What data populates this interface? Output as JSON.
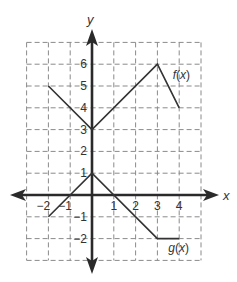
{
  "graph": {
    "x_axis_label": "x",
    "y_axis_label": "y",
    "x_range": [
      -3,
      5
    ],
    "y_range": [
      -3,
      7
    ],
    "x_tick_labels": [
      {
        "value": -2,
        "label": "−2"
      },
      {
        "value": -1,
        "label": "−1"
      },
      {
        "value": 1,
        "label": "1"
      },
      {
        "value": 2,
        "label": "2"
      },
      {
        "value": 3,
        "label": "3"
      },
      {
        "value": 4,
        "label": "4"
      }
    ],
    "y_tick_labels": [
      {
        "value": 6,
        "label": "6"
      },
      {
        "value": 5,
        "label": "5"
      },
      {
        "value": 4,
        "label": "4"
      },
      {
        "value": 3,
        "label": "3"
      },
      {
        "value": 2,
        "label": "2"
      },
      {
        "value": 1,
        "label": "1"
      },
      {
        "value": -1,
        "label": "−1"
      },
      {
        "value": -2,
        "label": "−2"
      }
    ],
    "functions": [
      {
        "name": "f",
        "label": "f(x)",
        "label_pos": [
          3.7,
          5.3
        ],
        "points": [
          [
            -2,
            5
          ],
          [
            0,
            3
          ],
          [
            3,
            6
          ],
          [
            4,
            4
          ]
        ]
      },
      {
        "name": "g",
        "label": "g(x)",
        "label_pos": [
          3.5,
          -2.6
        ],
        "points": [
          [
            -2,
            -1
          ],
          [
            0,
            1
          ],
          [
            3,
            -2
          ],
          [
            4,
            -2
          ]
        ]
      }
    ],
    "grid": true,
    "grid_style": "dashed"
  }
}
